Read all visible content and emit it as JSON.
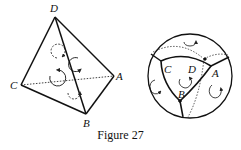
{
  "caption": "Figure 27",
  "left_figure": {
    "type": "tetrahedron",
    "vertices": {
      "D": [
        55,
        15
      ],
      "C": [
        20,
        85
      ],
      "A": [
        115,
        76
      ],
      "B": [
        87,
        115
      ]
    },
    "labels": [
      "D",
      "C",
      "A",
      "B"
    ]
  },
  "right_figure": {
    "type": "circle-projection",
    "labels": [
      "C",
      "D",
      "A",
      "B"
    ]
  }
}
